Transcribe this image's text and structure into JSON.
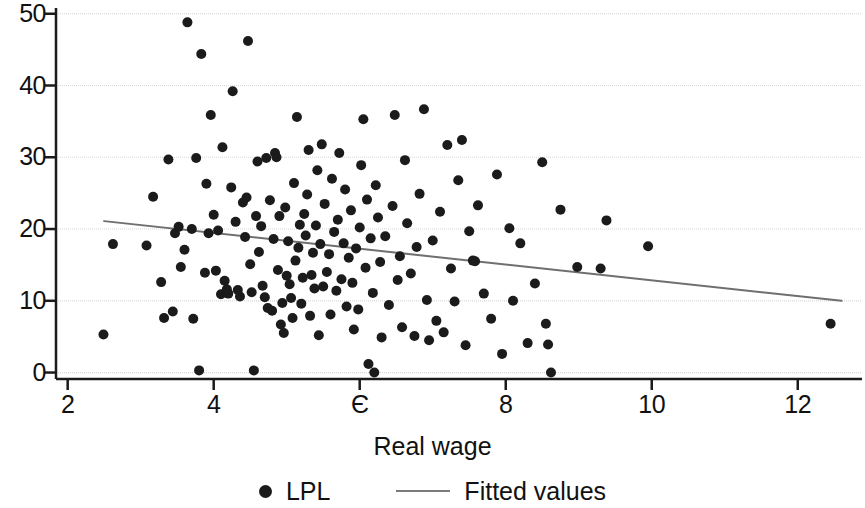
{
  "chart_data": {
    "type": "scatter",
    "title": "",
    "subtitle": "",
    "xlabel": "Real wage",
    "ylabel": "",
    "xlim": [
      1.84,
      12.88
    ],
    "ylim": [
      -0.9,
      50.8
    ],
    "xticks": [
      2,
      4,
      6,
      8,
      10,
      12
    ],
    "xtick_labels": [
      "2",
      "4",
      "Є",
      "8",
      "10",
      "12"
    ],
    "yticks": [
      0,
      10,
      20,
      30,
      40,
      50
    ],
    "ytick_labels": [
      "0",
      "10",
      "20",
      "30",
      "40",
      "50"
    ],
    "grid": "horizontal",
    "grid_color": "#d8d8d8",
    "axis_color": "#1b1b1b",
    "legend_position": "bottom-center",
    "series": [
      {
        "name": "LPL",
        "type": "scatter",
        "marker": "circle",
        "marker_size": 10,
        "color": "#1b1b1b",
        "points": [
          [
            2.49,
            5.3
          ],
          [
            2.62,
            17.9
          ],
          [
            3.08,
            17.7
          ],
          [
            3.17,
            24.5
          ],
          [
            3.28,
            12.6
          ],
          [
            3.32,
            7.6
          ],
          [
            3.38,
            29.7
          ],
          [
            3.44,
            8.5
          ],
          [
            3.47,
            19.4
          ],
          [
            3.52,
            20.3
          ],
          [
            3.55,
            14.7
          ],
          [
            3.6,
            17.1
          ],
          [
            3.64,
            48.8
          ],
          [
            3.7,
            20.0
          ],
          [
            3.72,
            7.5
          ],
          [
            3.76,
            29.9
          ],
          [
            3.8,
            0.3
          ],
          [
            3.83,
            44.4
          ],
          [
            3.88,
            13.9
          ],
          [
            3.9,
            26.3
          ],
          [
            3.93,
            19.4
          ],
          [
            3.96,
            35.9
          ],
          [
            4.0,
            22.0
          ],
          [
            4.03,
            14.2
          ],
          [
            4.06,
            19.8
          ],
          [
            4.1,
            10.9
          ],
          [
            4.12,
            31.4
          ],
          [
            4.15,
            12.8
          ],
          [
            4.18,
            11.6
          ],
          [
            4.2,
            11.0
          ],
          [
            4.24,
            25.8
          ],
          [
            4.26,
            39.2
          ],
          [
            4.3,
            21.0
          ],
          [
            4.33,
            11.5
          ],
          [
            4.36,
            10.6
          ],
          [
            4.4,
            23.7
          ],
          [
            4.43,
            18.9
          ],
          [
            4.45,
            24.4
          ],
          [
            4.47,
            46.2
          ],
          [
            4.5,
            15.1
          ],
          [
            4.52,
            11.2
          ],
          [
            4.55,
            0.3
          ],
          [
            4.58,
            21.8
          ],
          [
            4.6,
            29.4
          ],
          [
            4.62,
            16.8
          ],
          [
            4.65,
            20.4
          ],
          [
            4.67,
            12.1
          ],
          [
            4.7,
            10.5
          ],
          [
            4.72,
            29.9
          ],
          [
            4.74,
            9.0
          ],
          [
            4.77,
            24.0
          ],
          [
            4.8,
            8.6
          ],
          [
            4.82,
            18.6
          ],
          [
            4.84,
            30.6
          ],
          [
            4.86,
            30.0
          ],
          [
            4.88,
            14.3
          ],
          [
            4.9,
            21.8
          ],
          [
            4.92,
            6.7
          ],
          [
            4.94,
            9.7
          ],
          [
            4.96,
            5.5
          ],
          [
            4.98,
            23.0
          ],
          [
            5.0,
            13.5
          ],
          [
            5.02,
            18.3
          ],
          [
            5.04,
            12.3
          ],
          [
            5.06,
            10.4
          ],
          [
            5.08,
            7.6
          ],
          [
            5.1,
            26.4
          ],
          [
            5.12,
            15.6
          ],
          [
            5.14,
            35.6
          ],
          [
            5.16,
            17.4
          ],
          [
            5.18,
            20.6
          ],
          [
            5.2,
            9.6
          ],
          [
            5.22,
            13.2
          ],
          [
            5.24,
            22.1
          ],
          [
            5.26,
            19.1
          ],
          [
            5.28,
            24.8
          ],
          [
            5.3,
            31.0
          ],
          [
            5.32,
            7.9
          ],
          [
            5.34,
            13.6
          ],
          [
            5.36,
            16.7
          ],
          [
            5.38,
            11.7
          ],
          [
            5.4,
            20.5
          ],
          [
            5.42,
            28.2
          ],
          [
            5.44,
            5.2
          ],
          [
            5.46,
            17.9
          ],
          [
            5.48,
            31.8
          ],
          [
            5.5,
            12.0
          ],
          [
            5.52,
            23.5
          ],
          [
            5.55,
            14.0
          ],
          [
            5.58,
            16.5
          ],
          [
            5.6,
            8.1
          ],
          [
            5.62,
            27.0
          ],
          [
            5.65,
            19.6
          ],
          [
            5.68,
            11.4
          ],
          [
            5.7,
            21.3
          ],
          [
            5.72,
            30.6
          ],
          [
            5.75,
            13.0
          ],
          [
            5.78,
            18.0
          ],
          [
            5.8,
            25.5
          ],
          [
            5.82,
            9.2
          ],
          [
            5.85,
            16.0
          ],
          [
            5.88,
            22.6
          ],
          [
            5.9,
            12.5
          ],
          [
            5.92,
            6.0
          ],
          [
            5.95,
            17.3
          ],
          [
            5.98,
            8.8
          ],
          [
            6.0,
            20.2
          ],
          [
            6.02,
            28.9
          ],
          [
            6.05,
            35.3
          ],
          [
            6.08,
            14.6
          ],
          [
            6.1,
            24.1
          ],
          [
            6.12,
            1.2
          ],
          [
            6.15,
            18.7
          ],
          [
            6.18,
            11.1
          ],
          [
            6.2,
            0.0
          ],
          [
            6.22,
            26.1
          ],
          [
            6.25,
            21.6
          ],
          [
            6.28,
            15.4
          ],
          [
            6.3,
            4.9
          ],
          [
            6.35,
            19.0
          ],
          [
            6.4,
            9.4
          ],
          [
            6.45,
            23.2
          ],
          [
            6.48,
            35.9
          ],
          [
            6.52,
            12.9
          ],
          [
            6.55,
            16.2
          ],
          [
            6.58,
            6.3
          ],
          [
            6.62,
            29.6
          ],
          [
            6.65,
            20.8
          ],
          [
            6.7,
            13.8
          ],
          [
            6.75,
            5.1
          ],
          [
            6.78,
            17.5
          ],
          [
            6.82,
            24.9
          ],
          [
            6.88,
            36.7
          ],
          [
            6.92,
            10.1
          ],
          [
            6.95,
            4.5
          ],
          [
            7.0,
            18.4
          ],
          [
            7.05,
            7.2
          ],
          [
            7.1,
            22.4
          ],
          [
            7.15,
            5.6
          ],
          [
            7.2,
            31.7
          ],
          [
            7.25,
            14.5
          ],
          [
            7.3,
            9.9
          ],
          [
            7.35,
            26.8
          ],
          [
            7.4,
            32.4
          ],
          [
            7.45,
            3.8
          ],
          [
            7.5,
            19.7
          ],
          [
            7.55,
            15.6
          ],
          [
            7.58,
            15.5
          ],
          [
            7.62,
            23.3
          ],
          [
            7.7,
            11.0
          ],
          [
            7.8,
            7.5
          ],
          [
            7.88,
            27.6
          ],
          [
            7.95,
            2.6
          ],
          [
            8.05,
            20.1
          ],
          [
            8.1,
            10.0
          ],
          [
            8.2,
            18.0
          ],
          [
            8.3,
            4.1
          ],
          [
            8.4,
            12.4
          ],
          [
            8.5,
            29.3
          ],
          [
            8.55,
            6.8
          ],
          [
            8.58,
            3.9
          ],
          [
            8.62,
            0.0
          ],
          [
            8.75,
            22.7
          ],
          [
            8.98,
            14.7
          ],
          [
            9.3,
            14.5
          ],
          [
            9.38,
            21.2
          ],
          [
            9.95,
            17.6
          ],
          [
            12.45,
            6.8
          ]
        ]
      },
      {
        "name": "Fitted values",
        "type": "line",
        "color": "#6f6f6f",
        "width": 2,
        "endpoints": [
          [
            2.5,
            21.1
          ],
          [
            12.6,
            10.0
          ]
        ],
        "slope": -1.1,
        "intercept": 23.85
      }
    ]
  },
  "axes": {
    "x_label": "Real wage",
    "x_tick_labels": [
      "2",
      "4",
      "Є",
      "8",
      "10",
      "12"
    ],
    "y_tick_labels": [
      "0",
      "10",
      "20",
      "30",
      "40",
      "50"
    ]
  },
  "legend": {
    "entries": [
      {
        "label": "LPL",
        "marker": "dot-marker"
      },
      {
        "label": "Fitted values",
        "marker": "line-marker"
      }
    ]
  }
}
